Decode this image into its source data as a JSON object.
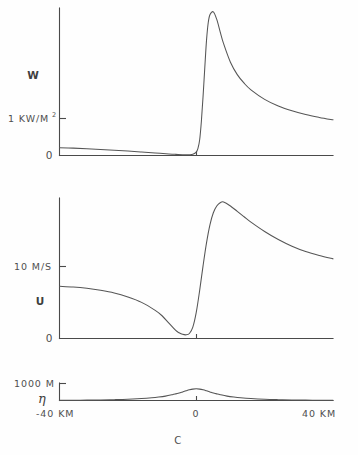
{
  "figure": {
    "caption": "C",
    "background_color": "#fefefe",
    "line_color": "#555555",
    "text_color": "#4f4f4f"
  },
  "chart_data": [
    {
      "type": "line",
      "panel": "top",
      "title": "",
      "ylabel": "W",
      "xlabel": "",
      "ytick_labels": [
        "1 KW/M",
        "0"
      ],
      "ytick_superscript": "2",
      "ytick_values": [
        1,
        0
      ],
      "yunits": "KW/M^2",
      "xlim": [
        -40,
        40
      ],
      "ylim": [
        0,
        3.1
      ],
      "grid": false,
      "legend": "none",
      "x": [
        -40,
        -36,
        -32,
        -28,
        -24,
        -20,
        -16,
        -12,
        -8,
        -6,
        -4,
        -3,
        -2,
        -1,
        0,
        0.5,
        1,
        1.5,
        2,
        2.5,
        3,
        3.5,
        4,
        5,
        6,
        7,
        8,
        10,
        12,
        14,
        16,
        20,
        24,
        28,
        32,
        36,
        40
      ],
      "y": [
        0.165,
        0.155,
        0.143,
        0.128,
        0.112,
        0.094,
        0.074,
        0.054,
        0.033,
        0.024,
        0.017,
        0.015,
        0.016,
        0.027,
        0.07,
        0.15,
        0.33,
        0.72,
        1.25,
        1.85,
        2.42,
        2.79,
        2.96,
        3.02,
        2.86,
        2.6,
        2.35,
        1.96,
        1.7,
        1.52,
        1.38,
        1.18,
        1.04,
        0.94,
        0.86,
        0.8,
        0.75
      ]
    },
    {
      "type": "line",
      "panel": "middle",
      "title": "",
      "ylabel": "U",
      "xlabel": "",
      "ytick_labels": [
        "10 M/S",
        "0"
      ],
      "ytick_values": [
        10,
        0
      ],
      "yunits": "M/S",
      "xlim": [
        -40,
        40
      ],
      "ylim": [
        0,
        21
      ],
      "grid": false,
      "legend": "none",
      "x": [
        -40,
        -36,
        -32,
        -28,
        -24,
        -20,
        -16,
        -12,
        -10,
        -8,
        -6,
        -5,
        -4,
        -3,
        -2,
        -1,
        0,
        1,
        2,
        3,
        4,
        5,
        6,
        7,
        8,
        10,
        12,
        14,
        16,
        20,
        24,
        28,
        32,
        36,
        40
      ],
      "y": [
        7.8,
        7.7,
        7.5,
        7.2,
        6.8,
        6.2,
        5.4,
        4.2,
        3.4,
        2.3,
        1.2,
        0.85,
        0.62,
        0.55,
        0.75,
        1.7,
        3.9,
        7.2,
        10.9,
        14.3,
        17.0,
        18.8,
        19.8,
        20.3,
        20.4,
        19.8,
        19.0,
        18.2,
        17.4,
        16.0,
        14.8,
        13.8,
        13.0,
        12.4,
        11.9
      ]
    },
    {
      "type": "line",
      "panel": "bottom",
      "title": "",
      "ylabel": "η",
      "xlabel": "C",
      "ytick_labels": [
        "1000 M"
      ],
      "ytick_values": [
        1000
      ],
      "yunits": "M",
      "xtick_labels": [
        "-40 KM",
        "0",
        "40 KM"
      ],
      "xtick_values": [
        -40,
        0,
        40
      ],
      "xlim": [
        -40,
        40
      ],
      "ylim": [
        0,
        1000
      ],
      "grid": false,
      "legend": "none",
      "x": [
        -40,
        -34,
        -28,
        -24,
        -20,
        -16,
        -13,
        -11,
        -9,
        -7,
        -6,
        -5,
        -4,
        -3,
        -2,
        -1,
        0,
        1,
        2,
        3,
        4,
        5,
        6,
        7,
        9,
        11,
        13,
        16,
        20,
        24,
        28,
        34,
        40
      ],
      "y": [
        10,
        18,
        32,
        48,
        72,
        112,
        155,
        195,
        250,
        330,
        378,
        432,
        492,
        552,
        608,
        650,
        668,
        650,
        608,
        552,
        492,
        432,
        378,
        330,
        250,
        195,
        155,
        112,
        72,
        48,
        32,
        18,
        10
      ]
    }
  ],
  "panels": {
    "top": {
      "y_axis_label": "W",
      "tick_label_main": "1 KW/M",
      "tick_label_sup": "2",
      "origin_label": "0"
    },
    "middle": {
      "y_axis_label": "U",
      "tick_label_main": "10 M/S",
      "origin_label": "0"
    },
    "bottom": {
      "y_axis_label": "η",
      "tick_label_main": "1000 M",
      "x_left_label": "-40 KM",
      "x_center_label": "0",
      "x_right_label": "40 KM"
    }
  }
}
